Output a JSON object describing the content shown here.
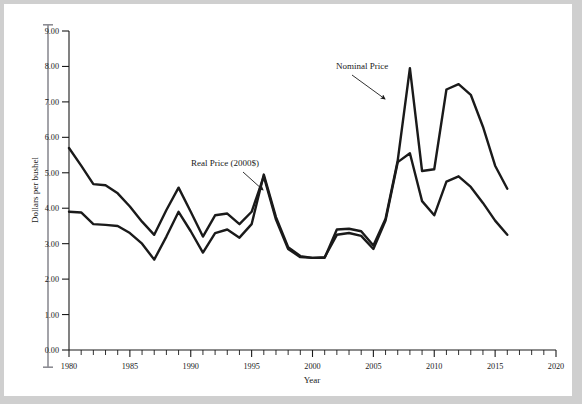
{
  "chart_data": {
    "type": "line",
    "title": "",
    "xlabel": "Year",
    "ylabel": "Dollars per bushel",
    "xlim": [
      1980,
      2020
    ],
    "ylim": [
      0,
      9
    ],
    "xticks": [
      1980,
      1985,
      1990,
      1995,
      2000,
      2005,
      2010,
      2015,
      2020
    ],
    "xtick_labels": [
      "1980",
      "1985",
      "1990",
      "1995",
      "2000",
      "2005",
      "2010",
      "2015",
      "2020"
    ],
    "x_minor_tick_step": 1,
    "yticks": [
      0,
      1,
      2,
      3,
      4,
      5,
      6,
      7,
      8,
      9
    ],
    "ytick_labels": [
      "0.00",
      "1.00",
      "2.00",
      "3.00",
      "4.00",
      "5.00",
      "6.00",
      "7.00",
      "8.00",
      "9.00"
    ],
    "grid": false,
    "legend_position": "inline-annotation",
    "x": [
      1980,
      1981,
      1982,
      1983,
      1984,
      1985,
      1986,
      1987,
      1988,
      1989,
      1990,
      1991,
      1992,
      1993,
      1994,
      1995,
      1996,
      1997,
      1998,
      1999,
      2000,
      2001,
      2002,
      2003,
      2004,
      2005,
      2006,
      2007,
      2008,
      2009,
      2010,
      2011,
      2012,
      2013,
      2014,
      2015,
      2016
    ],
    "series": [
      {
        "name": "Nominal Price",
        "color": "#1a1a1a",
        "label_text": "Nominal Price",
        "values": [
          3.9,
          3.88,
          3.55,
          3.53,
          3.5,
          3.3,
          3.0,
          2.55,
          3.2,
          3.9,
          3.35,
          2.75,
          3.3,
          3.4,
          3.17,
          3.55,
          4.95,
          3.75,
          2.9,
          2.65,
          2.6,
          2.62,
          3.25,
          3.3,
          3.22,
          2.85,
          3.65,
          5.3,
          5.55,
          4.2,
          3.8,
          4.75,
          4.9,
          4.6,
          4.15,
          3.65,
          3.25
        ]
      },
      {
        "name": "Real Price (2000$)",
        "color": "#1a1a1a",
        "label_text": "Real Price (2000$)",
        "values": [
          5.7,
          5.2,
          4.68,
          4.65,
          4.42,
          4.05,
          3.62,
          3.25,
          3.95,
          4.58,
          3.9,
          3.2,
          3.8,
          3.85,
          3.55,
          3.9,
          4.9,
          3.68,
          2.85,
          2.62,
          2.6,
          2.6,
          3.4,
          3.42,
          3.35,
          2.95,
          3.7,
          5.35,
          7.95,
          5.05,
          5.1,
          7.35,
          7.5,
          7.2,
          6.3,
          5.2,
          4.55
        ]
      }
    ],
    "annotations": [
      {
        "text": "Nominal Price",
        "text_x": 336,
        "text_y": 69,
        "arrow_from_x": 352,
        "arrow_from_y": 75,
        "arrow_to_x": 385,
        "arrow_to_y": 99
      },
      {
        "text": "Real Price (2000$)",
        "text_x": 191,
        "text_y": 166,
        "arrow_from_x": 243,
        "arrow_from_y": 172,
        "arrow_to_x": 263,
        "arrow_to_y": 190
      }
    ]
  }
}
